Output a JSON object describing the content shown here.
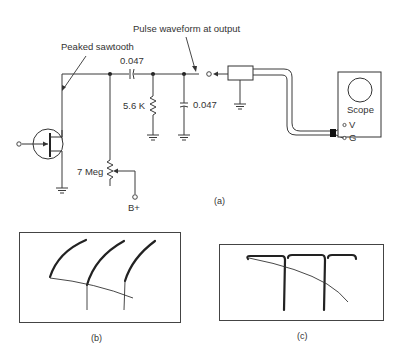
{
  "figure": {
    "annotations": {
      "peaked_sawtooth": "Peaked sawtooth",
      "pulse_waveform": "Pulse waveform at output"
    },
    "components": {
      "coupling_capacitor": "0.047",
      "resistor": "5.6 K",
      "shunt_capacitor": "0.047",
      "potentiometer": "7 Meg",
      "supply": "B+"
    },
    "scope": {
      "label": "Scope",
      "terminal_v": "V",
      "terminal_g": "G"
    },
    "captions": {
      "a": "(a)",
      "b": "(b)",
      "c": "(c)"
    },
    "colors": {
      "ink": "#333333",
      "background": "#ffffff"
    }
  }
}
